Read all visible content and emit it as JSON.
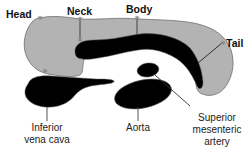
{
  "diagram": {
    "colors": {
      "pancreas_fill": "#b3b3b3",
      "pancreas_outline": "#6e6e6e",
      "vessel_fill": "#000000",
      "leader_line": "#222222",
      "marker": "#8a8a8a",
      "background": "#ffffff"
    },
    "pancreas_regions": [
      {
        "id": "head",
        "label": "Head"
      },
      {
        "id": "neck",
        "label": "Neck"
      },
      {
        "id": "body",
        "label": "Body"
      },
      {
        "id": "tail",
        "label": "Tail"
      }
    ],
    "structures": [
      {
        "id": "ivc",
        "label_line1": "Inferior",
        "label_line2": "vena cava"
      },
      {
        "id": "aorta",
        "label_line1": "Aorta"
      },
      {
        "id": "sma",
        "label_line1": "Superior",
        "label_line2": "mesenteric",
        "label_line3": "artery"
      }
    ]
  }
}
